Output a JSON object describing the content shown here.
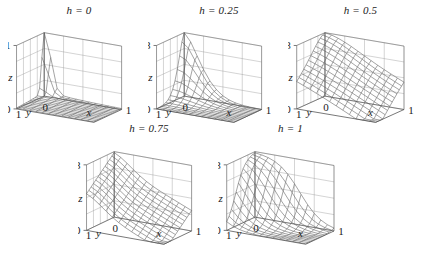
{
  "figure": {
    "kind": "multi-panel-3d-surface-grid",
    "panel_count": 5,
    "rows": [
      3,
      2
    ],
    "background_color": "#ffffff",
    "mesh_color": "#6b6b6b",
    "axis_color": "#555555",
    "text_color": "#1a1a1a"
  },
  "chart_data": [
    {
      "type": "surface",
      "title": "h = 0",
      "parameter": {
        "symbol": "h",
        "value": 0
      },
      "xlabel": "x",
      "ylabel": "y",
      "zlabel": "z",
      "xlim": [
        0,
        1
      ],
      "ylim": [
        0,
        1
      ],
      "zlim": [
        0,
        1
      ],
      "xticks": [
        0,
        1
      ],
      "yticks": [
        0,
        1
      ],
      "zticks": [
        0,
        1
      ],
      "xticklabels": [
        "0",
        "1"
      ],
      "yticklabels": [
        "1",
        "0"
      ],
      "zticklabels": [
        "0",
        "1"
      ],
      "grid": true,
      "legend": "none",
      "description": "Flat near zero over most of domain with a sharp narrow vertical spike rising to z = 1 at the far back corner (x = 0, y = 0 region).",
      "nx": 13,
      "ny": 13,
      "z_peak": 1.0,
      "z_plateau": 0.08
    },
    {
      "type": "surface",
      "title": "h = 0.25",
      "parameter": {
        "symbol": "h",
        "value": 0.25
      },
      "xlabel": "x",
      "ylabel": "y",
      "zlabel": "z",
      "xlim": [
        0,
        1
      ],
      "ylim": [
        0,
        1
      ],
      "zlim": [
        0,
        0.8
      ],
      "xticks": [
        0,
        1
      ],
      "yticks": [
        0,
        1
      ],
      "zticks": [
        0,
        0.8
      ],
      "xticklabels": [
        "0",
        "1"
      ],
      "yticklabels": [
        "1",
        "0"
      ],
      "zticklabels": [
        "0",
        "0.8"
      ],
      "grid": true,
      "legend": "none",
      "description": "Single sharp peak reaching z = 0.8 at the far back corner, decaying smoothly and monotonically toward the front edges.",
      "nx": 13,
      "ny": 13,
      "z_peak": 0.8,
      "z_plateau": 0.05
    },
    {
      "type": "surface",
      "title": "h = 0.5",
      "parameter": {
        "symbol": "h",
        "value": 0.5
      },
      "xlabel": "x",
      "ylabel": "y",
      "zlabel": "z",
      "xlim": [
        0,
        1
      ],
      "ylim": [
        0,
        1
      ],
      "zlim": [
        0,
        0.8
      ],
      "xticks": [
        0,
        1
      ],
      "yticks": [
        0,
        1
      ],
      "zticks": [
        0,
        0.8
      ],
      "xticklabels": [
        "0",
        "1"
      ],
      "yticklabels": [
        "1",
        "0"
      ],
      "zticklabels": [
        "0",
        "0.8"
      ],
      "grid": true,
      "legend": "none",
      "description": "Broad smooth dome rising toward the back corner at about z = 0.8, falling gently and almost planar toward the front right.",
      "nx": 13,
      "ny": 13,
      "z_peak": 0.8,
      "z_plateau": 0.1
    },
    {
      "type": "surface",
      "title": "h = 0.75",
      "parameter": {
        "symbol": "h",
        "value": 0.75
      },
      "xlabel": "x",
      "ylabel": "y",
      "zlabel": "z",
      "xlim": [
        0,
        1
      ],
      "ylim": [
        0,
        1
      ],
      "zlim": [
        0,
        0.8
      ],
      "xticks": [
        0,
        1
      ],
      "yticks": [
        0,
        1
      ],
      "zticks": [
        0,
        0.8
      ],
      "xticklabels": [
        "0",
        "1"
      ],
      "yticklabels": [
        "1",
        "0"
      ],
      "zticklabels": [
        "0",
        "0.8"
      ],
      "grid": true,
      "legend": "none",
      "description": "Elevated ridge along the back-left edge near z = 0.8 sloping down in a broad ramp toward the front right corner.",
      "nx": 13,
      "ny": 13,
      "z_peak": 0.8,
      "z_plateau": 0.05
    },
    {
      "type": "surface",
      "title": "h = 1",
      "parameter": {
        "symbol": "h",
        "value": 1
      },
      "xlabel": "x",
      "ylabel": "y",
      "zlabel": "z",
      "xlim": [
        0,
        1
      ],
      "ylim": [
        0,
        1
      ],
      "zlim": [
        0,
        0.8
      ],
      "xticks": [
        0,
        1
      ],
      "yticks": [
        0,
        1
      ],
      "zticks": [
        0,
        0.8
      ],
      "xticklabels": [
        "0",
        "1"
      ],
      "yticklabels": [
        "1",
        "0"
      ],
      "zticklabels": [
        "0",
        "0.8"
      ],
      "grid": true,
      "legend": "none",
      "description": "Flat-topped plateau at z = 0.8 across the back-left half dropping steeply to near zero over the front-right half.",
      "nx": 13,
      "ny": 13,
      "z_peak": 0.8,
      "z_plateau": 0.02
    }
  ],
  "panels": [
    {
      "id": "panel-h-0",
      "title": "h = 0",
      "left": 8,
      "top": 4,
      "width": 142,
      "height": 122
    },
    {
      "id": "panel-h-025",
      "title": "h = 0.25",
      "left": 148,
      "top": 4,
      "width": 142,
      "height": 122
    },
    {
      "id": "panel-h-05",
      "title": "h = 0.5",
      "left": 288,
      "top": 4,
      "width": 145,
      "height": 122
    },
    {
      "id": "panel-h-075",
      "title": "h = 0.75",
      "left": 78,
      "top": 122,
      "width": 142,
      "height": 126
    },
    {
      "id": "panel-h-1",
      "title": "h = 1",
      "left": 218,
      "top": 122,
      "width": 145,
      "height": 126
    }
  ],
  "axis_labels": {
    "x": "x",
    "y": "y",
    "z": "z",
    "zero": "0",
    "one": "1",
    "zmax_unit": "1",
    "zmax_point8": "0.8"
  }
}
